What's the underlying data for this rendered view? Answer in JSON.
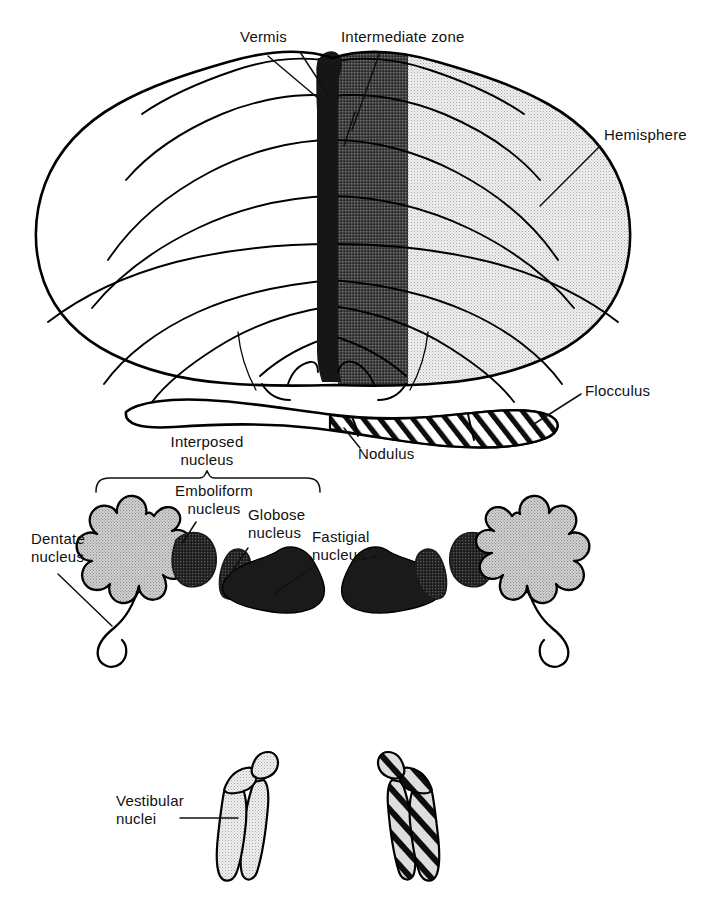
{
  "figure": {
    "background_color": "#ffffff",
    "ink_color": "#000000"
  },
  "palette": {
    "vermis_fill": "#161616",
    "intermediate_zone_fill": "#4e4e4e",
    "hemisphere_fill": "#ebebeb",
    "dentate_fill": "#d9d9d9",
    "nucleus_dark_fill": "#2b2b2b",
    "fastigial_fill": "#1a1a1a",
    "vestibular_fill": "#dcdcdc",
    "white_fill": "#ffffff"
  },
  "panels": [
    {
      "id": "panel-cerebellum",
      "name": "cerebellum-dorsal-view",
      "labels": [
        {
          "id": "vermis",
          "text": "Vermis",
          "x": 240,
          "y": 42,
          "anchor": "start"
        },
        {
          "id": "intermediate-zone",
          "text": "Intermediate zone",
          "x": 341,
          "y": 42,
          "anchor": "start"
        },
        {
          "id": "hemisphere",
          "text": "Hemisphere",
          "x": 604,
          "y": 140,
          "anchor": "start"
        },
        {
          "id": "flocculus",
          "text": "Flocculus",
          "x": 585,
          "y": 396,
          "anchor": "start"
        },
        {
          "id": "nodulus",
          "text": "Nodulus",
          "x": 358,
          "y": 459,
          "anchor": "start"
        }
      ]
    },
    {
      "id": "panel-deep-nuclei",
      "name": "deep-cerebellar-nuclei",
      "labels": [
        {
          "id": "interposed-nucleus",
          "text_line1": "Interposed",
          "text_line2": "nucleus",
          "x": 207,
          "y": 447,
          "anchor": "middle"
        },
        {
          "id": "emboliform-nucleus",
          "text_line1": "Emboliform",
          "text_line2": "nucleus",
          "x": 214,
          "y": 495,
          "anchor": "middle"
        },
        {
          "id": "globose-nucleus",
          "text_line1": "Globose",
          "text_line2": "nucleus",
          "x": 248,
          "y": 519,
          "anchor": "start"
        },
        {
          "id": "fastigial-nucleus",
          "text_line1": "Fastigial",
          "text_line2": "nucleus",
          "x": 312,
          "y": 541,
          "anchor": "start"
        },
        {
          "id": "dentate-nucleus",
          "text_line1": "Dentate",
          "text_line2": "nucleus",
          "x": 31,
          "y": 543,
          "anchor": "start"
        }
      ],
      "brace": {
        "id": "interposed-brace",
        "x_start": 96,
        "x_end": 320,
        "y": 478
      }
    },
    {
      "id": "panel-vestibular",
      "name": "vestibular-nuclei",
      "labels": [
        {
          "id": "vestibular-nuclei",
          "text_line1": "Vestibular",
          "text_line2": "nuclei",
          "x": 116,
          "y": 805,
          "anchor": "start"
        }
      ]
    }
  ],
  "structures": [
    {
      "id": "vermis",
      "name": "Vermis",
      "fill": "#161616",
      "pattern": "solid"
    },
    {
      "id": "intermediate-zone",
      "name": "Intermediate zone",
      "fill": "#4e4e4e",
      "pattern": "stipple-dark"
    },
    {
      "id": "hemisphere-right",
      "name": "Hemisphere (right)",
      "fill": "#ebebeb",
      "pattern": "stipple-light"
    },
    {
      "id": "hemisphere-left",
      "name": "Hemisphere (left)",
      "fill": "#ffffff",
      "pattern": "none"
    },
    {
      "id": "flocculus-left",
      "name": "Flocculus (left)",
      "fill": "#ffffff",
      "pattern": "none"
    },
    {
      "id": "flocculus-right",
      "name": "Flocculus (right)",
      "fill": "#ffffff",
      "pattern": "diagonal-hatch"
    },
    {
      "id": "nodulus",
      "name": "Nodulus",
      "fill": "#ffffff",
      "pattern": "diagonal-hatch"
    },
    {
      "id": "dentate-left",
      "name": "Dentate nucleus (left)",
      "fill": "#d9d9d9",
      "pattern": "stipple-light"
    },
    {
      "id": "dentate-right",
      "name": "Dentate nucleus (right)",
      "fill": "#d9d9d9",
      "pattern": "stipple-light"
    },
    {
      "id": "emboliform-left",
      "name": "Emboliform nucleus (left)",
      "fill": "#2b2b2b",
      "pattern": "stipple-dark"
    },
    {
      "id": "emboliform-right",
      "name": "Emboliform nucleus (right)",
      "fill": "#2b2b2b",
      "pattern": "stipple-dark"
    },
    {
      "id": "globose-left",
      "name": "Globose nucleus (left)",
      "fill": "#2b2b2b",
      "pattern": "stipple-dark"
    },
    {
      "id": "globose-right",
      "name": "Globose nucleus (right)",
      "fill": "#2b2b2b",
      "pattern": "stipple-dark"
    },
    {
      "id": "fastigial-left",
      "name": "Fastigial nucleus (left)",
      "fill": "#1a1a1a",
      "pattern": "solid"
    },
    {
      "id": "fastigial-right",
      "name": "Fastigial nucleus (right)",
      "fill": "#1a1a1a",
      "pattern": "solid"
    },
    {
      "id": "vestibular-left",
      "name": "Vestibular nuclei (left)",
      "fill": "#dcdcdc",
      "pattern": "stipple-light"
    },
    {
      "id": "vestibular-right",
      "name": "Vestibular nuclei (right)",
      "fill": "#dcdcdc",
      "pattern": "diagonal-hatch"
    }
  ]
}
